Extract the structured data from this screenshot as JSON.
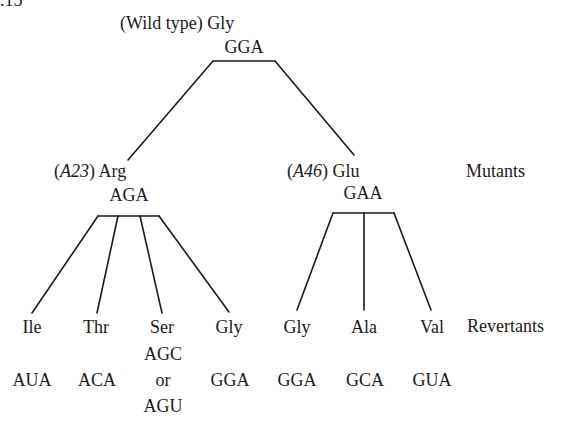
{
  "figure": {
    "number_fragment": ".15",
    "wild_type": {
      "prefix": "(Wild type)",
      "amino_acid": "Gly",
      "codon": "GGA"
    },
    "mutants": [
      {
        "open_paren": "(",
        "allele": "A23",
        "close_paren": ")",
        "amino_acid": "Arg",
        "codon": "AGA"
      },
      {
        "open_paren": "(",
        "allele": "A46",
        "close_paren": ")",
        "amino_acid": "Glu",
        "codon": "GAA"
      }
    ],
    "row_labels": {
      "mutants": "Mutants",
      "revertants": "Revertants"
    },
    "revertants": [
      {
        "amino_acid": "Ile",
        "codon": "AUA"
      },
      {
        "amino_acid": "Thr",
        "codon": "ACA"
      },
      {
        "amino_acid": "Ser",
        "codon_line1": "AGC",
        "codon_or": "or",
        "codon_line2": "AGU"
      },
      {
        "amino_acid": "Gly",
        "codon": "GGA"
      },
      {
        "amino_acid": "Gly",
        "codon": "GGA"
      },
      {
        "amino_acid": "Ala",
        "codon": "GCA"
      },
      {
        "amino_acid": "Val",
        "codon": "GUA"
      }
    ]
  }
}
